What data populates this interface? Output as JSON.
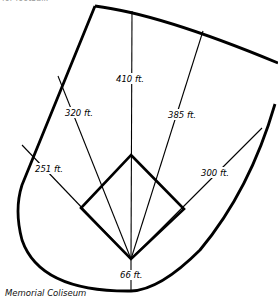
{
  "top_note": "for football.",
  "caption": "Memorial Coliseum",
  "distances": {
    "center": "410 ft.",
    "right_center": "385 ft.",
    "left_center": "320 ft.",
    "left_field": "251 ft.",
    "right_field": "300 ft.",
    "backstop": "66 ft."
  }
}
